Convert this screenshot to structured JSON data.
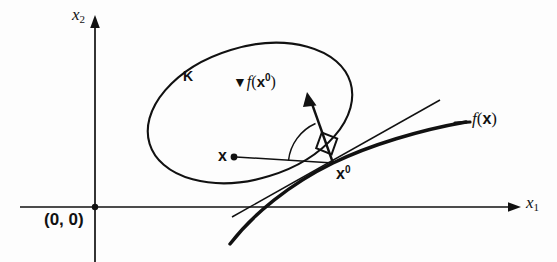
{
  "figure": {
    "type": "math-diagram",
    "background_color": "#fdfdfd",
    "ink_color": "#111111"
  },
  "axes": {
    "x_label": "x",
    "x_subscript": "1",
    "y_label": "x",
    "y_subscript": "2",
    "origin_label": "(0, 0)"
  },
  "labels": {
    "set": "K",
    "point_x": "x",
    "point_x0": "x",
    "point_x0_sup": "0",
    "gradient_nabla": "▼",
    "gradient_fn": "f",
    "gradient_open": "(",
    "gradient_vec": "x",
    "gradient_sup": "0",
    "gradient_close": ")",
    "curve_fn": "f",
    "curve_open": "(",
    "curve_vec": "x",
    "curve_close": ")"
  },
  "geometry": {
    "y_axis_x": 95,
    "x_axis_y": 207,
    "x_point": [
      233,
      157
    ],
    "x0_point": [
      333,
      163
    ],
    "gradient_tip": [
      307,
      95
    ],
    "ellipse_center": [
      250,
      113
    ],
    "ellipse_rx": 105,
    "ellipse_ry": 66,
    "ellipse_rotation": -17
  }
}
